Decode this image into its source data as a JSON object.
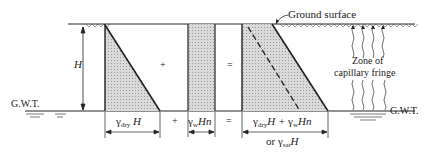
{
  "labels": {
    "ground_surface": "Ground surface",
    "gwt_left": "G.W.T.",
    "gwt_right": "G.W.T.",
    "height": "H",
    "zone_line1": "Zone of",
    "zone_line2": "capillary fringe",
    "plus_inside": "+",
    "equals_inside": "=",
    "plus_below": "+",
    "equals_below": "=",
    "or": "or"
  },
  "terms": {
    "dry": {
      "symbol": "γ",
      "sub": "dry",
      "var": "H"
    },
    "water": {
      "symbol": "γ",
      "sub": "w",
      "var": "Hn"
    },
    "sum": {
      "sym1": "γ",
      "sub1": "dry",
      "var1": "H + ",
      "sym2": "γ",
      "sub2": "w",
      "var2": "Hn"
    },
    "sat": {
      "symbol": "γ",
      "sub": "sat",
      "var": "H"
    }
  },
  "colors": {
    "line": "#222222",
    "fill": "#d4d4d4",
    "background": "#ffffff"
  }
}
